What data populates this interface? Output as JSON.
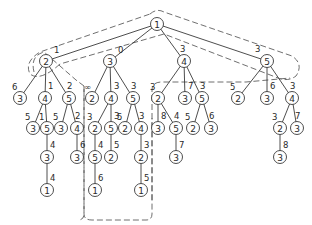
{
  "diagram": {
    "type": "search-tree",
    "root": "n0",
    "nodes": [
      {
        "id": "n0",
        "label": "1"
      },
      {
        "id": "a",
        "label": "2",
        "parent": "n0",
        "edge": "1"
      },
      {
        "id": "b",
        "label": "3",
        "parent": "n0",
        "edge": "0"
      },
      {
        "id": "c",
        "label": "4",
        "parent": "n0",
        "edge": "3"
      },
      {
        "id": "d",
        "label": "5",
        "parent": "n0",
        "edge": "3"
      },
      {
        "id": "a1",
        "label": "3",
        "parent": "a",
        "edge": "6"
      },
      {
        "id": "a2",
        "label": "4",
        "parent": "a",
        "edge": "1"
      },
      {
        "id": "a3",
        "label": "5",
        "parent": "a",
        "edge": "2"
      },
      {
        "id": "b1",
        "label": "2",
        "parent": "b",
        "edge": "∞"
      },
      {
        "id": "b2",
        "label": "4",
        "parent": "b",
        "edge": "3"
      },
      {
        "id": "b3",
        "label": "5",
        "parent": "b",
        "edge": "3"
      },
      {
        "id": "c1",
        "label": "2",
        "parent": "c",
        "edge": "3"
      },
      {
        "id": "c2",
        "label": "3",
        "parent": "c",
        "edge": "7"
      },
      {
        "id": "c3",
        "label": "5",
        "parent": "c",
        "edge": "3"
      },
      {
        "id": "d1",
        "label": "2",
        "parent": "d",
        "edge": "5"
      },
      {
        "id": "d2",
        "label": "3",
        "parent": "d",
        "edge": "6"
      },
      {
        "id": "d3",
        "label": "4",
        "parent": "d",
        "edge": "3"
      },
      {
        "id": "a21",
        "label": "3",
        "parent": "a2",
        "edge": "5"
      },
      {
        "id": "a22",
        "label": "5",
        "parent": "a2",
        "edge": "1"
      },
      {
        "id": "a31",
        "label": "3",
        "parent": "a3",
        "edge": "5"
      },
      {
        "id": "a32",
        "label": "4",
        "parent": "a3",
        "edge": "2"
      },
      {
        "id": "b21",
        "label": "2",
        "parent": "b2",
        "edge": "3"
      },
      {
        "id": "b22",
        "label": "5",
        "parent": "b2",
        "edge": "3"
      },
      {
        "id": "b31",
        "label": "2",
        "parent": "b3",
        "edge": "5"
      },
      {
        "id": "b32",
        "label": "4",
        "parent": "b3",
        "edge": "3"
      },
      {
        "id": "c11",
        "label": "3",
        "parent": "c1",
        "edge": "8"
      },
      {
        "id": "c12",
        "label": "5",
        "parent": "c1",
        "edge": "4"
      },
      {
        "id": "c31",
        "label": "2",
        "parent": "c3",
        "edge": "5"
      },
      {
        "id": "c32",
        "label": "3",
        "parent": "c3",
        "edge": "6"
      },
      {
        "id": "d31",
        "label": "2",
        "parent": "d3",
        "edge": "3"
      },
      {
        "id": "d32",
        "label": "3",
        "parent": "d3",
        "edge": "7"
      },
      {
        "id": "a221",
        "label": "3",
        "parent": "a22",
        "edge": "4"
      },
      {
        "id": "a321",
        "label": "3",
        "parent": "a32",
        "edge": "6"
      },
      {
        "id": "b211",
        "label": "5",
        "parent": "b21",
        "edge": "4"
      },
      {
        "id": "b221",
        "label": "2",
        "parent": "b22",
        "edge": "5"
      },
      {
        "id": "b321",
        "label": "2",
        "parent": "b32",
        "edge": "3"
      },
      {
        "id": "c121",
        "label": "3",
        "parent": "c12",
        "edge": "7"
      },
      {
        "id": "d311",
        "label": "3",
        "parent": "d31",
        "edge": "8"
      },
      {
        "id": "a2211",
        "label": "1",
        "parent": "a221",
        "edge": "4"
      },
      {
        "id": "b2111",
        "label": "1",
        "parent": "b211",
        "edge": "6"
      },
      {
        "id": "b3211",
        "label": "1",
        "parent": "b321",
        "edge": "5"
      }
    ],
    "regions": [
      {
        "name": "root-region"
      },
      {
        "name": "subtree-2-region"
      },
      {
        "name": "subtree-3-region"
      },
      {
        "name": "subtree-4-5-region"
      }
    ]
  }
}
